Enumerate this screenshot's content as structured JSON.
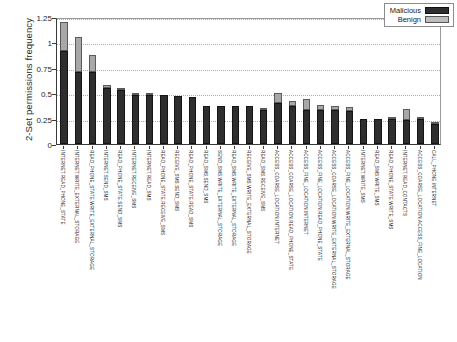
{
  "chart_data": {
    "type": "bar",
    "subtype": "stacked",
    "title": "",
    "xlabel": "",
    "ylabel": "2-Set permissions frequency",
    "ylim": [
      0,
      1.25
    ],
    "yticks": [
      "0",
      "0.25",
      "0.5",
      "0.75",
      "1",
      "1.25"
    ],
    "ytick_values": [
      0,
      0.25,
      0.5,
      0.75,
      1,
      1.25
    ],
    "grid": true,
    "legend_position": "top-right",
    "legend": [
      {
        "name": "Malicious",
        "color": "#2e2e2e"
      },
      {
        "name": "Benign",
        "color": "#bdbdbd"
      }
    ],
    "categories": [
      "INTERNET,READ_PHONE_STATE",
      "INTERNET,WRITE_EXTERNAL_STORAGE",
      "READ_PHONE_STATE,WRITE_EXTERNAL_STORAGE",
      "INTERNET,SEND_SMS",
      "READ_PHONE_STATE,SEND_SMS",
      "INTERNET,RECEIVE_SMS",
      "INTERNET,READ_SMS",
      "READ_PHONE_STATE,RECEIVE_SMS",
      "RECEIVE_SMS,SEND_SMS",
      "READ_PHONE_STATE,READ_SMS",
      "READ_SMS,SEND_SMS",
      "SEND_SMS,WRITE_EXTERNAL_STORAGE",
      "READ_SMS,WRITE_EXTERNAL_STORAGE",
      "RECEIVE_SMS,WRITE_EXTERNAL_STORAGE",
      "READ_SMS,RECEIVE_SMS",
      "ACCESS_COARSE_LOCATION,INTERNET",
      "ACCESS_COARSE_LOCATION,READ_PHONE_STATE",
      "ACCESS_FINE_LOCATION,INTERNET",
      "ACCESS_FINE_LOCATION,READ_PHONE_STATE",
      "ACCESS_COARSE_LOCATION,WRITE_EXTERNAL_STORAGE",
      "ACCESS_FINE_LOCATION,WRITE_EXTERNAL_STORAGE",
      "INTERNET,WRITE_SMS",
      "READ_SMS,WRITE_SMS",
      "READ_PHONE_STATE,WRITE_SMS",
      "INTERNET,READ_CONTACTS",
      "ACCESS_COARSE_LOCATION,ACCESS_FINE_LOCATION",
      "CALL_PHONE,INTERNET"
    ],
    "series": [
      {
        "name": "Malicious",
        "color": "#2e2e2e",
        "values": [
          0.92,
          0.71,
          0.705,
          0.555,
          0.53,
          0.485,
          0.483,
          0.478,
          0.473,
          0.465,
          0.37,
          0.37,
          0.37,
          0.37,
          0.335,
          0.4,
          0.375,
          0.33,
          0.335,
          0.33,
          0.325,
          0.25,
          0.25,
          0.245,
          0.24,
          0.245,
          0.2
        ]
      },
      {
        "name": "Benign",
        "color": "#bdbdbd",
        "values": [
          0.28,
          0.34,
          0.175,
          0.025,
          0.015,
          0.005,
          0.005,
          0.0,
          0.0,
          0.0,
          0.0,
          0.0,
          0.0,
          0.0,
          0.02,
          0.105,
          0.05,
          0.115,
          0.045,
          0.045,
          0.04,
          0.0,
          0.0,
          0.005,
          0.1,
          0.02,
          0.015
        ]
      }
    ],
    "totals": [
      1.2,
      1.05,
      0.88,
      0.58,
      0.545,
      0.49,
      0.488,
      0.478,
      0.473,
      0.465,
      0.37,
      0.37,
      0.37,
      0.37,
      0.355,
      0.505,
      0.425,
      0.445,
      0.38,
      0.375,
      0.365,
      0.25,
      0.25,
      0.25,
      0.34,
      0.265,
      0.215
    ]
  }
}
